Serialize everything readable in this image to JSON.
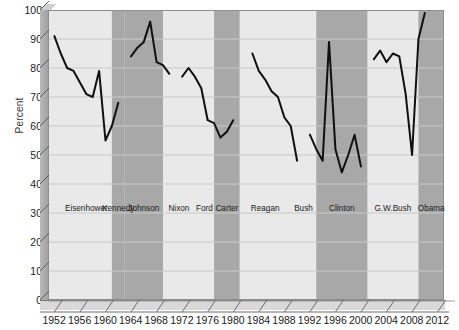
{
  "chart_data": {
    "type": "line",
    "title": "",
    "xlabel": "",
    "ylabel": "Percent",
    "xlim": [
      1951,
      2013
    ],
    "ylim": [
      0,
      100
    ],
    "grid": true,
    "legend_position": "none",
    "xticks": [
      1952,
      1956,
      1960,
      1964,
      1968,
      1972,
      1976,
      1980,
      1984,
      1988,
      1992,
      1996,
      2000,
      2004,
      2008,
      2012
    ],
    "yticks": [
      0,
      10,
      20,
      30,
      40,
      50,
      60,
      70,
      80,
      90,
      100
    ],
    "series": [
      {
        "name": "Percent",
        "x": [
          1952,
          1953,
          1954,
          1955,
          1956,
          1957,
          1958,
          1959,
          1960,
          1961,
          1962,
          1963,
          1964,
          1965,
          1966,
          1967,
          1968,
          1969,
          1970,
          1971,
          1972,
          1973,
          1974,
          1975,
          1976,
          1977,
          1978,
          1979,
          1980,
          1981,
          1982,
          1983,
          1984,
          1985,
          1986,
          1987,
          1988,
          1989,
          1990,
          1991,
          1992,
          1993,
          1994,
          1995,
          1996,
          1997,
          1998,
          1999,
          2000,
          2001,
          2002,
          2003,
          2004,
          2005,
          2006,
          2007,
          2008,
          2009,
          2010,
          2011,
          2012
        ],
        "y": [
          91,
          85,
          80,
          79,
          75,
          71,
          70,
          79,
          55,
          60,
          68,
          null,
          84,
          87,
          89,
          96,
          82,
          81,
          78,
          null,
          77,
          80,
          77,
          73,
          62,
          61,
          56,
          58,
          62,
          null,
          null,
          85,
          79,
          76,
          72,
          70,
          63,
          60,
          48,
          null,
          57,
          52,
          48,
          89,
          52,
          44,
          50,
          57,
          46,
          null,
          83,
          86,
          82,
          85,
          84,
          71,
          50,
          90,
          99,
          null,
          null
        ]
      }
    ],
    "bands": [
      {
        "label": "Eisenhower",
        "start": 1953,
        "end": 1961,
        "shaded": false
      },
      {
        "label": "Kennedy",
        "start": 1961,
        "end": 1963,
        "shaded": true
      },
      {
        "label": "Johnson",
        "start": 1963,
        "end": 1969,
        "shaded": true
      },
      {
        "label": "Nixon",
        "start": 1969,
        "end": 1974,
        "shaded": false
      },
      {
        "label": "Ford",
        "start": 1974,
        "end": 1977,
        "shaded": false
      },
      {
        "label": "Carter",
        "start": 1977,
        "end": 1981,
        "shaded": true
      },
      {
        "label": "Reagan",
        "start": 1981,
        "end": 1989,
        "shaded": false
      },
      {
        "label": "Bush",
        "start": 1989,
        "end": 1993,
        "shaded": false
      },
      {
        "label": "Clinton",
        "start": 1993,
        "end": 2001,
        "shaded": true
      },
      {
        "label": "G.W.Bush",
        "start": 2001,
        "end": 2009,
        "shaded": false
      },
      {
        "label": "Obama",
        "start": 2009,
        "end": 2013,
        "shaded": true
      }
    ],
    "colors": {
      "line": "#101010",
      "plot_background": "#e9e9e9",
      "band_shaded": "#a8a8a8",
      "axis": "#5c5c5c",
      "grid": "#c9c9c9",
      "text": "#1b1b1b"
    }
  }
}
